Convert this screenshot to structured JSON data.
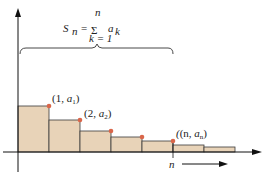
{
  "diagram": {
    "formula": {
      "lhs": "S",
      "lhs_sub": "n",
      "equals": "=",
      "sigma": "Σ",
      "upper_limit": "n",
      "lower_limit": "k = 1",
      "term": "a",
      "term_sub": "k"
    },
    "points": [
      {
        "label_open": "(1, ",
        "var": "a",
        "sub": "1",
        "close": ")"
      },
      {
        "label_open": "(2, ",
        "var": "a",
        "sub": "2",
        "close": ")"
      },
      {
        "label_open": "(n, ",
        "var": "a",
        "sub": "n",
        "close": ")"
      }
    ],
    "x_marker_label": "n",
    "colors": {
      "bar_fill": "#e8d3b8",
      "bar_stroke": "#3a3a3a",
      "point": "#d9664a",
      "axis": "#111111"
    },
    "bars": [
      {
        "x": 18,
        "top": 106
      },
      {
        "x": 49,
        "top": 120
      },
      {
        "x": 80,
        "top": 131
      },
      {
        "x": 111,
        "top": 137
      },
      {
        "x": 142,
        "top": 141
      },
      {
        "x": 173,
        "top": 145
      },
      {
        "x": 204,
        "top": 147
      }
    ]
  }
}
